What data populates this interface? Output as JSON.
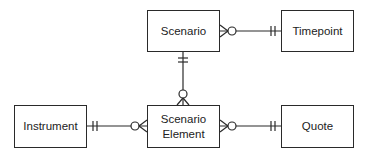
{
  "diagram": {
    "type": "entity-relationship",
    "entities": [
      {
        "id": "scenario",
        "label": "Scenario"
      },
      {
        "id": "timepoint",
        "label": "Timepoint"
      },
      {
        "id": "instrument",
        "label": "Instrument"
      },
      {
        "id": "scenario_element",
        "label_line1": "Scenario",
        "label_line2": "Element"
      },
      {
        "id": "quote",
        "label": "Quote"
      }
    ],
    "relationships": [
      {
        "from": "scenario",
        "to": "timepoint",
        "from_end": "zero-or-many",
        "to_end": "one-and-only-one"
      },
      {
        "from": "scenario",
        "to": "scenario_element",
        "from_end": "one-and-only-one",
        "to_end": "zero-or-many"
      },
      {
        "from": "instrument",
        "to": "scenario_element",
        "from_end": "one-and-only-one",
        "to_end": "zero-or-many"
      },
      {
        "from": "scenario_element",
        "to": "quote",
        "from_end": "zero-or-many",
        "to_end": "one-and-only-one"
      }
    ],
    "colors": {
      "line": "#2a2a2a",
      "text": "#222222",
      "background": "#ffffff"
    }
  }
}
